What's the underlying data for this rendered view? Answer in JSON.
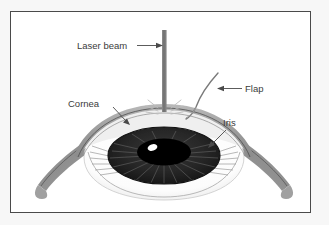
{
  "figure": {
    "background_color": "#f7f7f7",
    "panel_color": "#ffffff",
    "border_color": "#4a4a4a",
    "panel": {
      "x": 10,
      "y": 11,
      "width": 301,
      "height": 202
    }
  },
  "labels": {
    "laser_beam": "Laser beam",
    "flap": "Flap",
    "cornea": "Cornea",
    "iris": "Iris"
  },
  "colors": {
    "sclera_band": "#8f8f8f",
    "sclera_band_dark": "#6f6f6f",
    "cornea_outer": "#9a9a9a",
    "cornea_inner": "#e9e9e9",
    "globe_white": "#ffffff",
    "iris_dark": "#2a2a2a",
    "pupil": "#000000",
    "highlight": "#ffffff",
    "laser_beam": "#7d7d7d",
    "leader_line": "#4a4a4a",
    "text": "#3b3b3b"
  },
  "parts": [
    {
      "name": "laser-beam",
      "label": "Laser beam"
    },
    {
      "name": "corneal-flap",
      "label": "Flap"
    },
    {
      "name": "cornea",
      "label": "Cornea"
    },
    {
      "name": "iris",
      "label": "Iris"
    },
    {
      "name": "pupil",
      "label": "Pupil"
    },
    {
      "name": "sclera",
      "label": "Sclera"
    }
  ]
}
